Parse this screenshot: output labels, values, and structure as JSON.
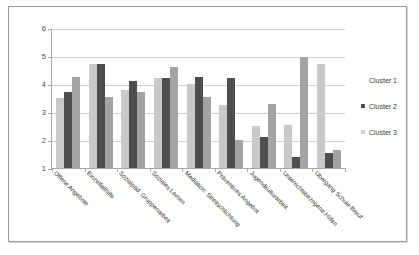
{
  "chart_data": {
    "type": "bar",
    "title": "",
    "subtitle": "",
    "xlabel": "",
    "ylabel": "",
    "ylim": [
      1,
      6
    ],
    "yticks": [
      1,
      2,
      3,
      4,
      5,
      6
    ],
    "ytick_labels": [
      "1",
      "2",
      "3",
      "4",
      "5",
      "6"
    ],
    "grid": true,
    "legend_position": "right",
    "categories": [
      "Offene Angebote",
      "Einzelfallhilfe",
      "Sozialpäd. Gruppenarbeit",
      "Soziales Lernen",
      "Mediation: Streitschlichtung",
      "Präventives Angebot",
      "Jugendkulturarbeit",
      "Unterrichtsbezogene Hilfen",
      "Übergang Schule-Beruf"
    ],
    "series": [
      {
        "name": "Cluster 1",
        "color": "#c9c9c9",
        "values": [
          3.5,
          4.7,
          3.8,
          4.2,
          4.0,
          3.25,
          2.5,
          2.55,
          4.7
        ]
      },
      {
        "name": "Cluster 2",
        "color": "#4e4e4e",
        "values": [
          3.7,
          4.72,
          4.1,
          4.2,
          4.25,
          4.2,
          2.1,
          1.4,
          1.55
        ]
      },
      {
        "name": "Cluster 3",
        "color": "#a3a3a3",
        "values": [
          4.25,
          3.55,
          3.7,
          4.6,
          3.55,
          2.0,
          3.3,
          4.95,
          1.65
        ]
      }
    ]
  },
  "legend": {
    "items": [
      {
        "label": "Cluster 1"
      },
      {
        "label": "Cluster 2"
      },
      {
        "label": "Cluster 3"
      }
    ]
  },
  "colors": {
    "frame_border": "#9a9a9a",
    "axis": "#a8a8a8",
    "gridline": "#d2d2d2",
    "background": "#ffffff"
  }
}
